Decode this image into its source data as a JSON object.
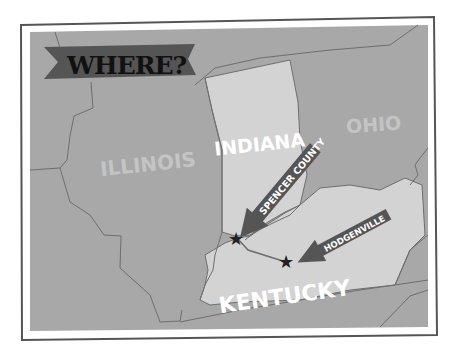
{
  "title": "WHERE?",
  "states": [
    {
      "id": "illinois",
      "label": "ILLINOIS",
      "color": "#c4c4c4"
    },
    {
      "id": "indiana",
      "label": "INDIANA",
      "color": "#ffffff"
    },
    {
      "id": "ohio",
      "label": "OHIO",
      "color": "#c4c4c4"
    },
    {
      "id": "kentucky",
      "label": "KENTUCKY",
      "color": "#ffffff"
    }
  ],
  "markers": [
    {
      "id": "spencer-county",
      "label": "SPENCER COUNTY"
    },
    {
      "id": "hodgenville",
      "label": "HODGENVILLE"
    }
  ],
  "colors": {
    "background": "#a8a8a8",
    "highlight": "#d3d3d3",
    "border_line": "#6e6e6e",
    "banner": "#555555",
    "arrow": "#555555",
    "star": "#222222",
    "frame": "#555555"
  }
}
